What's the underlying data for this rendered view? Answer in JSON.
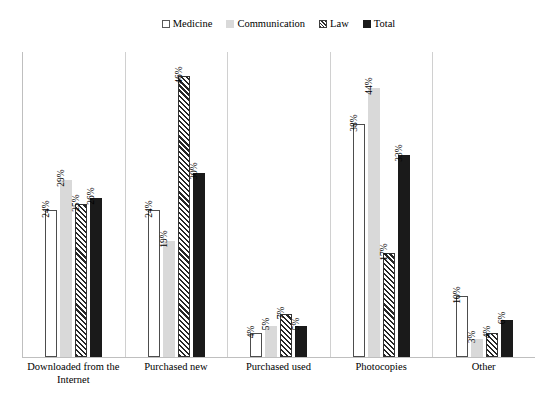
{
  "chart_data": {
    "type": "bar",
    "title": "",
    "subtitle": "",
    "xlabel": "",
    "ylabel": "",
    "grid": false,
    "legend_position": "top-center",
    "ylim": [
      0,
      50
    ],
    "categories": [
      "Downloaded from the Internet",
      "Purchased new",
      "Purchased used",
      "Photocopies",
      "Other"
    ],
    "series": [
      {
        "name": "Medicine",
        "color": "#ffffff",
        "pattern": "outline",
        "values": [
          24,
          24,
          4,
          38,
          10
        ],
        "labels": [
          "24%",
          "24%",
          "4%",
          "38%",
          "10%"
        ]
      },
      {
        "name": "Communication",
        "color": "#d9d9d9",
        "pattern": "solid",
        "values": [
          29,
          19,
          5,
          44,
          3
        ],
        "labels": [
          "29%",
          "19%",
          "5%",
          "44%",
          "3%"
        ]
      },
      {
        "name": "Law",
        "color": "#262626",
        "pattern": "diagonal",
        "values": [
          25,
          46,
          7,
          17,
          4
        ],
        "labels": [
          "25%",
          "46%",
          "7%",
          "17%",
          "4%"
        ]
      },
      {
        "name": "Total",
        "color": "#1a1a1a",
        "pattern": "solid",
        "values": [
          26,
          30,
          5,
          33,
          6
        ],
        "labels": [
          "26%",
          "30%",
          "5%",
          "33%",
          "6%"
        ]
      }
    ]
  },
  "legend": {
    "items": [
      {
        "label": "Medicine",
        "swatch": "legend-swatch-medicine"
      },
      {
        "label": "Communication",
        "swatch": "legend-swatch-communication"
      },
      {
        "label": "Law",
        "swatch": "legend-swatch-law"
      },
      {
        "label": "Total",
        "swatch": "legend-swatch-total"
      }
    ]
  }
}
